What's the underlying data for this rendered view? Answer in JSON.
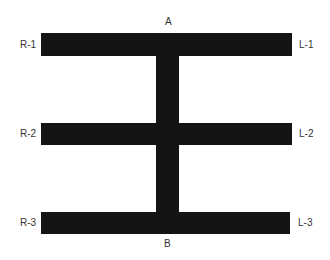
{
  "diagram": {
    "colors": {
      "bar": "#141414",
      "background": "#ffffff",
      "label": "#333333"
    },
    "labels": {
      "top": "A",
      "bottom": "B",
      "left": [
        "R-1",
        "R-2",
        "R-3"
      ],
      "right": [
        "L-1",
        "L-2",
        "L-3"
      ]
    }
  }
}
